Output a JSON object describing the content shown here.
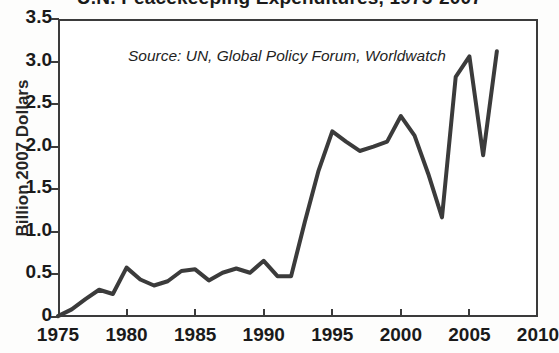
{
  "chart_data": {
    "type": "line",
    "title": "U.N. Peacekeeping Expenditures, 1975-2007",
    "source_note": "Source: UN, Global Policy Forum, Worldwatch",
    "xlabel": "",
    "ylabel": "Billion 2007 Dollars",
    "xlim": [
      1975,
      2010
    ],
    "ylim": [
      0,
      3.5
    ],
    "xticks": [
      1975,
      1980,
      1985,
      1990,
      1995,
      2000,
      2005,
      2010
    ],
    "xtick_labels": [
      "1975",
      "1980",
      "1985",
      "1990",
      "1995",
      "2000",
      "2005",
      "2010"
    ],
    "yticks": [
      0,
      0.5,
      1.0,
      1.5,
      2.0,
      2.5,
      3.0,
      3.5
    ],
    "ytick_labels": [
      "0",
      "0.5",
      "1.0",
      "1.5",
      "2.0",
      "2.5",
      "3.0",
      "3.5"
    ],
    "grid": false,
    "legend": "none",
    "line_color": "#3b3b3b",
    "line_width": 4,
    "x": [
      1975,
      1976,
      1977,
      1978,
      1979,
      1980,
      1981,
      1982,
      1983,
      1984,
      1985,
      1986,
      1987,
      1988,
      1989,
      1990,
      1991,
      1992,
      1993,
      1994,
      1995,
      1996,
      1997,
      1998,
      1999,
      2000,
      2001,
      2002,
      2003,
      2004,
      2005,
      2006,
      2007
    ],
    "values": [
      0.01,
      0.09,
      0.21,
      0.32,
      0.27,
      0.58,
      0.44,
      0.37,
      0.42,
      0.54,
      0.56,
      0.43,
      0.52,
      0.57,
      0.52,
      0.66,
      0.48,
      0.48,
      1.12,
      1.72,
      2.18,
      2.06,
      1.95,
      2.0,
      2.06,
      2.36,
      2.13,
      1.68,
      1.17,
      2.82,
      3.06,
      1.9,
      3.12
    ]
  },
  "axis": {
    "y_title": "Billion 2007 Dollars"
  }
}
